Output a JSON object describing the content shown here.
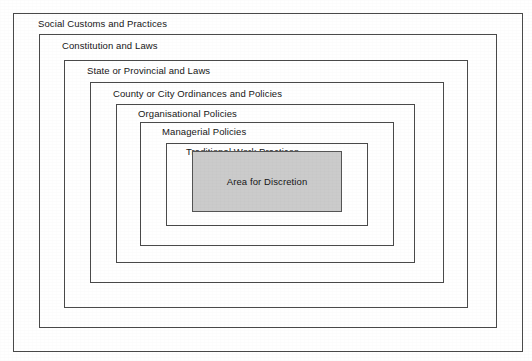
{
  "diagram": {
    "type": "nested-boxes",
    "background_color": "#ffffff",
    "border_color": "#4a4a4a",
    "fill_color": "#cbcbcb",
    "text_color": "#161616",
    "layers": [
      {
        "id": "social-customs-and-practices",
        "label": "Social Customs and Practices",
        "level": 1,
        "filled": false,
        "label_align": "left",
        "rect": {
          "x": 13,
          "y": 13,
          "w": 510,
          "h": 339
        },
        "label_pos": {
          "x": 38,
          "y": 18
        }
      },
      {
        "id": "constitution-and-laws",
        "label": "Constitution and Laws",
        "level": 2,
        "filled": false,
        "label_align": "left",
        "rect": {
          "x": 39,
          "y": 34,
          "w": 458,
          "h": 294
        },
        "label_pos": {
          "x": 62,
          "y": 40
        }
      },
      {
        "id": "state-or-provincial-and-laws",
        "label": "State or Provincial and Laws",
        "level": 3,
        "filled": false,
        "label_align": "left",
        "rect": {
          "x": 64,
          "y": 60,
          "w": 404,
          "h": 248
        },
        "label_pos": {
          "x": 87,
          "y": 65
        }
      },
      {
        "id": "county-or-city-ordinances-and-policies",
        "label": "County or City Ordinances and Policies",
        "level": 4,
        "filled": false,
        "label_align": "left",
        "rect": {
          "x": 90,
          "y": 82,
          "w": 354,
          "h": 201
        },
        "label_pos": {
          "x": 113,
          "y": 88
        }
      },
      {
        "id": "organisational-policies",
        "label": "Organisational Policies",
        "level": 5,
        "filled": false,
        "label_align": "left",
        "rect": {
          "x": 116,
          "y": 104,
          "w": 299,
          "h": 159
        },
        "label_pos": {
          "x": 138,
          "y": 108
        }
      },
      {
        "id": "managerial-policies",
        "label": "Managerial Policies",
        "level": 6,
        "filled": false,
        "label_align": "left",
        "rect": {
          "x": 140,
          "y": 122,
          "w": 254,
          "h": 124
        },
        "label_pos": {
          "x": 162,
          "y": 126
        }
      },
      {
        "id": "traditional-work-practices",
        "label": "Traditional Work Practices",
        "level": 7,
        "filled": false,
        "label_align": "left",
        "rect": {
          "x": 166,
          "y": 143,
          "w": 202,
          "h": 83
        },
        "label_pos": {
          "x": 186,
          "y": 146
        }
      },
      {
        "id": "area-for-discretion",
        "label": "Area for Discretion",
        "level": 8,
        "filled": true,
        "label_align": "center",
        "rect": {
          "x": 192,
          "y": 151,
          "w": 150,
          "h": 61
        },
        "label_pos": {
          "x": 192,
          "y": 176
        }
      }
    ]
  }
}
